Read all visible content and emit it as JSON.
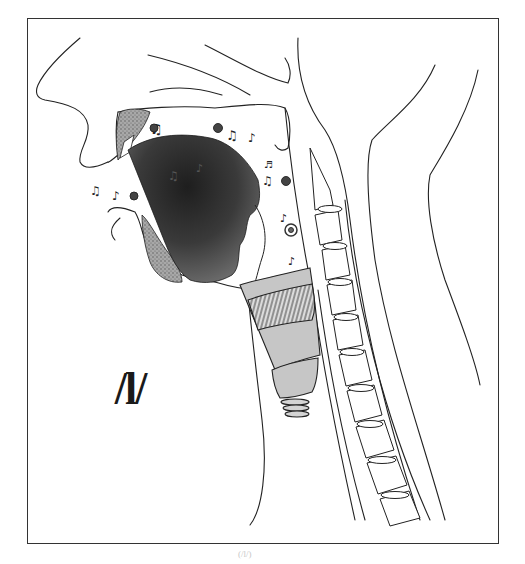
{
  "figure": {
    "type": "midsagittal vocal tract illustration",
    "phoneme_label": "/l/",
    "caption": "(/l/)",
    "colors": {
      "outline": "#222222",
      "tongue_dark": "#2a2a2a",
      "tongue_light": "#777777",
      "larynx_fill": "#c4c4c4",
      "stipple_fill": "#9a9a9a",
      "background": "#ffffff"
    },
    "structures": [
      "face-profile",
      "nasal-cavity",
      "hard-palate",
      "soft-palate",
      "tongue",
      "lower-jaw",
      "upper-teeth",
      "pharynx",
      "epiglottis",
      "larynx",
      "trachea",
      "cervical-spine",
      "back-of-neck"
    ],
    "decorations": [
      "music-notes",
      "sound-swirls"
    ]
  }
}
